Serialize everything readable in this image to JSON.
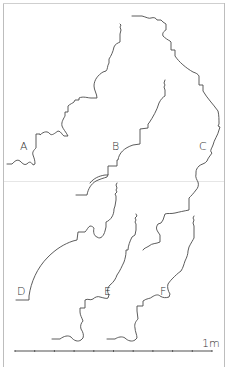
{
  "figure": {
    "profiles": [
      {
        "id": "A",
        "label": "A"
      },
      {
        "id": "B",
        "label": "B"
      },
      {
        "id": "C",
        "label": "C"
      },
      {
        "id": "D",
        "label": "D"
      },
      {
        "id": "E",
        "label": "E"
      },
      {
        "id": "F",
        "label": "F"
      }
    ],
    "scale": {
      "label": "1m",
      "length_m": 1,
      "divisions": 10
    }
  }
}
